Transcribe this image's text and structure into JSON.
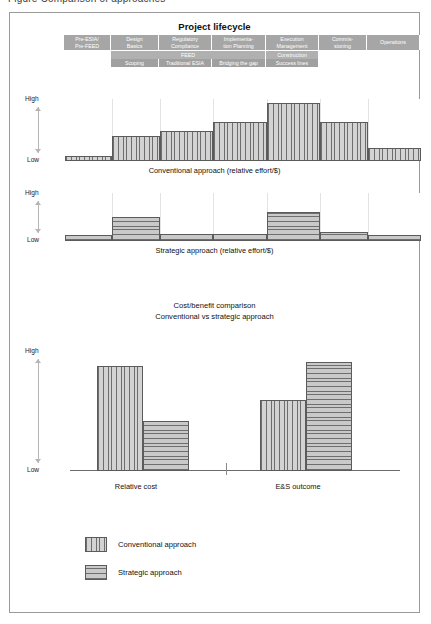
{
  "caption_sliver": "Figure  Comparison of approaches",
  "figure": {
    "lifecycle_title": "Project lifecycle",
    "phases": [
      {
        "label": "Pre-ESIA/\nPre-FEED",
        "x": 55,
        "w": 47
      },
      {
        "label": "Design\nBasics",
        "x": 102,
        "w": 48
      },
      {
        "label": "Regulatory\nCompliance",
        "x": 150,
        "w": 53
      },
      {
        "label": "Implementa-\ntion Planning",
        "x": 203,
        "w": 54
      },
      {
        "label": "Execution\nManagement",
        "x": 257,
        "w": 53
      },
      {
        "label": "Commis-\nsioning",
        "x": 310,
        "w": 48
      },
      {
        "label": "Operations",
        "x": 358,
        "w": 53
      }
    ],
    "subrow_feed": [
      {
        "label": "FEED",
        "x": 102,
        "w": 155
      },
      {
        "label": "Construction",
        "x": 257,
        "w": 53
      }
    ],
    "subrow_detail": [
      {
        "label": "Scoping",
        "x": 102,
        "w": 48
      },
      {
        "label": "Traditional ESIA",
        "x": 150,
        "w": 53
      },
      {
        "label": "Bridging the gap",
        "x": 203,
        "w": 54
      },
      {
        "label": "Success lines",
        "x": 257,
        "w": 53
      }
    ],
    "axis_high": "High",
    "axis_low": "Low",
    "caption_conventional": "Conventional approach (relative effort/$)",
    "caption_strategic": "Strategic approach (relative effort/$)",
    "costbenefit_title_line1": "Cost/benefit comparison",
    "costbenefit_title_line2": "Conventional vs strategic approach",
    "group_relative_cost": "Relative cost",
    "group_es_outcome": "E&S outcome",
    "legend": [
      {
        "label": "Conventional approach",
        "pattern": "vhatch"
      },
      {
        "label": "Strategic approach",
        "pattern": "hhatch"
      }
    ],
    "colors": {
      "header_band": "#a6a6a6",
      "bar_fill": "#d3d3d3",
      "bar_stroke": "#5b5b5b",
      "frame": "#9a9a9a",
      "gridline": "#e3e3e3",
      "arrow": "#b5b5b5"
    }
  },
  "chart_data": [
    {
      "type": "bar",
      "title": "Conventional approach (relative effort/$)",
      "xlabel": "Project lifecycle",
      "ylabel": "relative effort/$",
      "ylim": [
        0,
        100
      ],
      "ytick_labels": [
        "Low",
        "High"
      ],
      "grid": true,
      "legend_position": "none",
      "series_name": "Conventional approach",
      "pattern": "vertical-hatch",
      "categories": [
        "Pre-ESIA/Pre-FEED",
        "Design Basics",
        "Regulatory Compliance",
        "Implementation Planning",
        "Execution Management",
        "Commissioning",
        "Operations"
      ],
      "values": [
        8,
        42,
        50,
        65,
        96,
        65,
        22
      ]
    },
    {
      "type": "bar",
      "title": "Strategic approach (relative effort/$)",
      "xlabel": "Project lifecycle",
      "ylabel": "relative effort/$",
      "ylim": [
        0,
        100
      ],
      "ytick_labels": [
        "Low",
        "High"
      ],
      "grid": true,
      "legend_position": "none",
      "series_name": "Strategic approach",
      "pattern": "horizontal-hatch",
      "categories": [
        "Pre-ESIA/Pre-FEED",
        "Design Basics",
        "Regulatory Compliance",
        "Implementation Planning",
        "Execution Management",
        "Commissioning",
        "Operations"
      ],
      "values": [
        12,
        52,
        16,
        16,
        62,
        20,
        12
      ]
    },
    {
      "type": "bar",
      "title": "Cost/benefit comparison Conventional vs strategic approach",
      "xlabel": "",
      "ylabel": "",
      "ylim": [
        0,
        100
      ],
      "ytick_labels": [
        "Low",
        "High"
      ],
      "grid": false,
      "legend_position": "bottom-left",
      "categories": [
        "Relative cost",
        "E&S outcome"
      ],
      "series": [
        {
          "name": "Conventional approach",
          "pattern": "vertical-hatch",
          "values": [
            92,
            62
          ]
        },
        {
          "name": "Strategic approach",
          "pattern": "horizontal-hatch",
          "values": [
            44,
            96
          ]
        }
      ]
    }
  ]
}
